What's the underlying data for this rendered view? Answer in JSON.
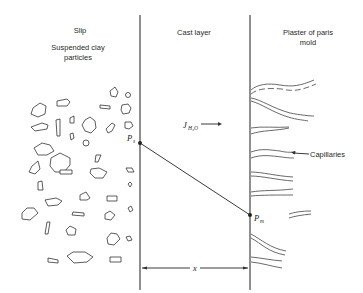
{
  "diagram": {
    "regions": {
      "slip": {
        "title": "Slip",
        "subtitle_line1": "Suspended clay",
        "subtitle_line2": "particles"
      },
      "cast_layer": {
        "title": "Cast layer"
      },
      "mold": {
        "title_line1": "Plaster of paris",
        "title_line2": "mold"
      }
    },
    "points": {
      "slip_pressure": {
        "symbol": "P",
        "subscript": "s"
      },
      "mold_pressure": {
        "symbol": "P",
        "subscript": "m"
      }
    },
    "flux": {
      "symbol": "J",
      "subscript": "H₂O"
    },
    "thickness": {
      "symbol": "x"
    },
    "callouts": {
      "capillaries": "Capillaries"
    },
    "colors": {
      "line": "#333333",
      "background": "#ffffff"
    }
  }
}
